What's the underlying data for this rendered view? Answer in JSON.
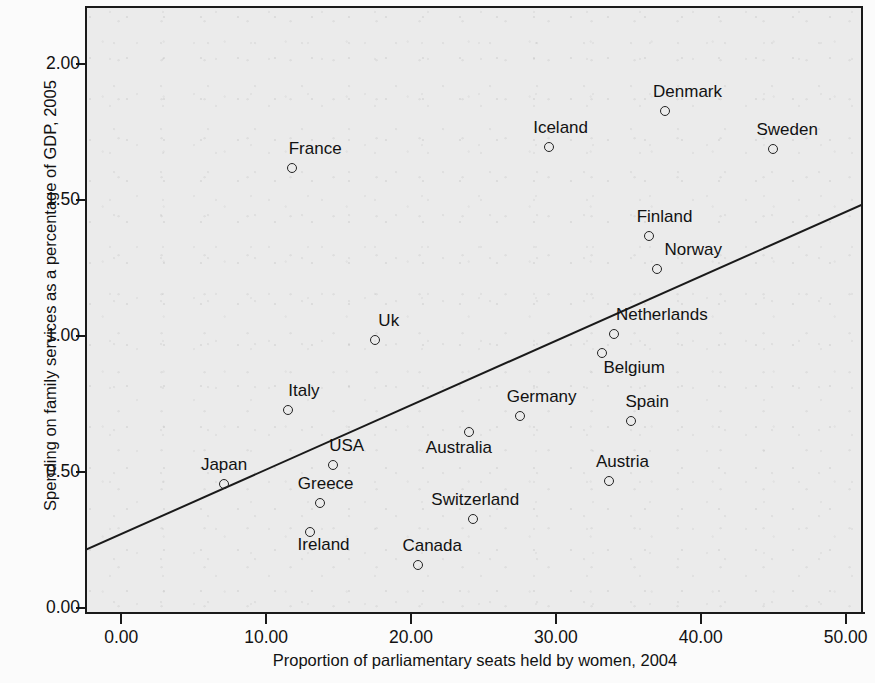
{
  "chart_data": {
    "type": "scatter",
    "title": "",
    "xlabel": "Proportion of parliamentary seats held by women, 2004",
    "ylabel": "Spending on family services as a percentage of GDP, 2005",
    "xlim": [
      -2.5,
      51.2
    ],
    "ylim": [
      -0.02,
      2.21
    ],
    "grid": false,
    "legend": "none",
    "xticks": [
      "0.00",
      "10.00",
      "20.00",
      "30.00",
      "40.00",
      "50.00"
    ],
    "xtick_values": [
      0,
      10,
      20,
      30,
      40,
      50
    ],
    "yticks": [
      "0.00",
      "0.50",
      "1.00",
      "1.50",
      "2.00"
    ],
    "ytick_values": [
      0,
      0.5,
      1.0,
      1.5,
      2.0
    ],
    "marker": "open-circle",
    "point_color": "#232323",
    "plot_background": "#ebebeb",
    "trendline": {
      "label": "linear fit",
      "color": "#1a1a1a",
      "x_start": -2.5,
      "y_start": 0.215,
      "x_end": 51.2,
      "y_end": 1.488
    },
    "points": [
      {
        "label": "Japan",
        "x": 7.1,
        "y": 0.46,
        "label_dx": 0,
        "label_dy": -9
      },
      {
        "label": "Italy",
        "x": 11.5,
        "y": 0.73,
        "label_dx": 16,
        "label_dy": -9
      },
      {
        "label": "France",
        "x": 11.8,
        "y": 1.62,
        "label_dx": 23,
        "label_dy": -9
      },
      {
        "label": "Ireland",
        "x": 13.0,
        "y": 0.28,
        "label_dx": 14,
        "label_dy": 23
      },
      {
        "label": "Greece",
        "x": 13.7,
        "y": 0.39,
        "label_dx": 6,
        "label_dy": -9
      },
      {
        "label": "USA",
        "x": 14.6,
        "y": 0.53,
        "label_dx": 14,
        "label_dy": -9
      },
      {
        "label": "Uk",
        "x": 17.5,
        "y": 0.99,
        "label_dx": 14,
        "label_dy": -9
      },
      {
        "label": "Canada",
        "x": 20.5,
        "y": 0.16,
        "label_dx": 14,
        "label_dy": -9
      },
      {
        "label": "Australia",
        "x": 24.0,
        "y": 0.65,
        "label_dx": -10,
        "label_dy": 26
      },
      {
        "label": "Switzerland",
        "x": 24.3,
        "y": 0.33,
        "label_dx": 2,
        "label_dy": -9
      },
      {
        "label": "Germany",
        "x": 27.5,
        "y": 0.71,
        "label_dx": 22,
        "label_dy": -9
      },
      {
        "label": "Iceland",
        "x": 29.5,
        "y": 1.7,
        "label_dx": 12,
        "label_dy": -9
      },
      {
        "label": "Belgium",
        "x": 33.2,
        "y": 0.94,
        "label_dx": 32,
        "label_dy": 25
      },
      {
        "label": "Austria",
        "x": 33.7,
        "y": 0.47,
        "label_dx": 13,
        "label_dy": -9
      },
      {
        "label": "Netherlands",
        "x": 34.0,
        "y": 1.01,
        "label_dx": 48,
        "label_dy": -9
      },
      {
        "label": "Spain",
        "x": 35.2,
        "y": 0.69,
        "label_dx": 16,
        "label_dy": -9
      },
      {
        "label": "Finland",
        "x": 36.4,
        "y": 1.37,
        "label_dx": 16,
        "label_dy": -9
      },
      {
        "label": "Norway",
        "x": 37.0,
        "y": 1.25,
        "label_dx": 36,
        "label_dy": -9
      },
      {
        "label": "Denmark",
        "x": 37.5,
        "y": 1.83,
        "label_dx": 23,
        "label_dy": -9
      },
      {
        "label": "Sweden",
        "x": 45.0,
        "y": 1.69,
        "label_dx": 14,
        "label_dy": -9
      }
    ]
  }
}
